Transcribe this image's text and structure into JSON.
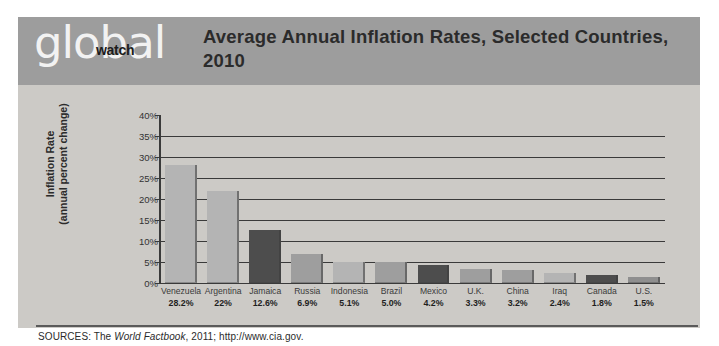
{
  "logo": {
    "primary": "global",
    "secondary": "watch"
  },
  "header": {
    "title": "Average Annual Inflation Rates, Selected Countries, 2010",
    "band_color": "#9d9d9d"
  },
  "footer": {
    "sources_prefix": "SOURCES: The ",
    "sources_italic": "World Factbook",
    "sources_suffix": ", 2011; http://www.cia.gov."
  },
  "colors": {
    "card_background": "#cccac6",
    "bar_light": "#b4b4b4",
    "bar_dark": "#4d4d4d",
    "axis": "#3a3a3a",
    "text": "#2b2b2b"
  },
  "chart_data": {
    "type": "bar",
    "title": "Average Annual Inflation Rates, Selected Countries, 2010",
    "xlabel": "",
    "ylabel": "Inflation Rate (annual percent change)",
    "ylabel_line1": "Inflation Rate",
    "ylabel_line2": "(annual percent change)",
    "ylim": [
      0,
      40
    ],
    "ytick_step": 5,
    "yticks": [
      "0%",
      "5%",
      "10%",
      "15%",
      "20%",
      "25%",
      "30%",
      "35%",
      "40%"
    ],
    "ytick_values": [
      0,
      5,
      10,
      15,
      20,
      25,
      30,
      35,
      40
    ],
    "grid": true,
    "legend": "none",
    "categories": [
      "Venezuela",
      "Argentina",
      "Jamaica",
      "Russia",
      "Indonesia",
      "Brazil",
      "Mexico",
      "U.K.",
      "China",
      "Iraq",
      "Canada",
      "U.S."
    ],
    "values": [
      28.2,
      22,
      12.6,
      6.9,
      5.1,
      5.0,
      4.2,
      3.3,
      3.2,
      2.4,
      1.8,
      1.5
    ],
    "value_labels": [
      "28.2%",
      "22%",
      "12.6%",
      "6.9%",
      "5.1%",
      "5.0%",
      "4.2%",
      "3.3%",
      "3.2%",
      "2.4%",
      "1.8%",
      "1.5%"
    ],
    "bar_colors": [
      "#b4b4b4",
      "#b4b4b4",
      "#4d4d4d",
      "#9e9e9e",
      "#b4b4b4",
      "#9e9e9e",
      "#4d4d4d",
      "#9e9e9e",
      "#9e9e9e",
      "#b4b4b4",
      "#4d4d4d",
      "#8f8f8f"
    ]
  }
}
